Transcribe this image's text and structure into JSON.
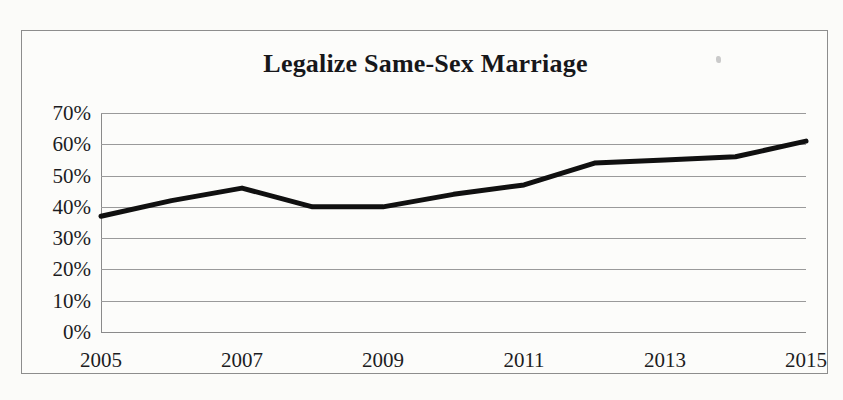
{
  "chart_data": {
    "type": "line",
    "title": "Legalize Same-Sex Marriage",
    "xlabel": "",
    "ylabel": "",
    "x": [
      2005,
      2006,
      2007,
      2008,
      2009,
      2010,
      2011,
      2012,
      2013,
      2014,
      2015
    ],
    "values": [
      37,
      42,
      46,
      40,
      40,
      44,
      47,
      54,
      55,
      56,
      61
    ],
    "series": [
      {
        "name": "Legalize Same-Sex Marriage",
        "values": [
          37,
          42,
          46,
          40,
          40,
          44,
          47,
          54,
          55,
          56,
          61
        ]
      }
    ],
    "xlim": [
      2005,
      2015
    ],
    "ylim": [
      0,
      70
    ],
    "y_ticks": [
      70,
      60,
      50,
      40,
      30,
      20,
      10,
      0
    ],
    "y_tick_labels": [
      "70%",
      "60%",
      "50%",
      "40%",
      "30%",
      "20%",
      "10%",
      "0%"
    ],
    "x_ticks": [
      2005,
      2007,
      2009,
      2011,
      2013,
      2015
    ],
    "x_tick_labels": [
      "2005",
      "2007",
      "2009",
      "2011",
      "2013",
      "2015"
    ],
    "grid": "horizontal",
    "legend": "none",
    "line_color": "#101010",
    "grid_color": "#9a9a9a",
    "background_color": "#fcfcfa",
    "border_color": "#8d8d8d"
  },
  "figure": {
    "title": "Legalize Same-Sex Marriage",
    "artifact_label": "scan-speck"
  }
}
